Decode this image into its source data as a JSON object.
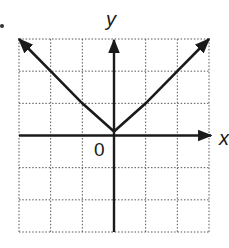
{
  "chart_data": {
    "type": "line",
    "title": "",
    "function": "y = |x|",
    "xlabel": "x",
    "ylabel": "y",
    "origin_label": "0",
    "xlim": [
      -3,
      3
    ],
    "ylim": [
      -3,
      3
    ],
    "grid": true,
    "grid_style": "dotted",
    "tick_labels": [],
    "series": [
      {
        "name": "y = |x|",
        "x": [
          -3,
          -2,
          -1,
          0,
          1,
          2,
          3
        ],
        "y": [
          3,
          2,
          1,
          0,
          1,
          2,
          3
        ],
        "arrows_at_ends": true
      }
    ],
    "legend": null
  },
  "labels": {
    "x_axis": "x",
    "y_axis": "y",
    "origin": "0"
  },
  "colors": {
    "line": "#1a1a1a",
    "grid": "#555555",
    "background": "#ffffff"
  }
}
